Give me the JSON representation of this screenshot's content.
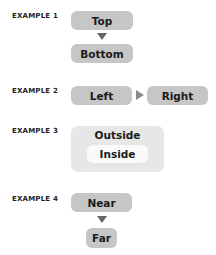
{
  "examples": [
    {
      "label": "EXAMPLE 1",
      "first": "Top",
      "second": "Bottom",
      "direction": "down"
    },
    {
      "label": "EXAMPLE 2",
      "first": "Left",
      "second": "Right",
      "direction": "right"
    },
    {
      "label": "EXAMPLE 3",
      "outer": "Outside",
      "inner": "Inside",
      "direction": "nested"
    },
    {
      "label": "EXAMPLE 4",
      "first": "Near",
      "second": "Far",
      "direction": "down"
    }
  ],
  "colors": {
    "box": "#c6c6c6",
    "outer": "#e7e7e7",
    "inner": "#fafafa",
    "arrow": "#666666"
  }
}
